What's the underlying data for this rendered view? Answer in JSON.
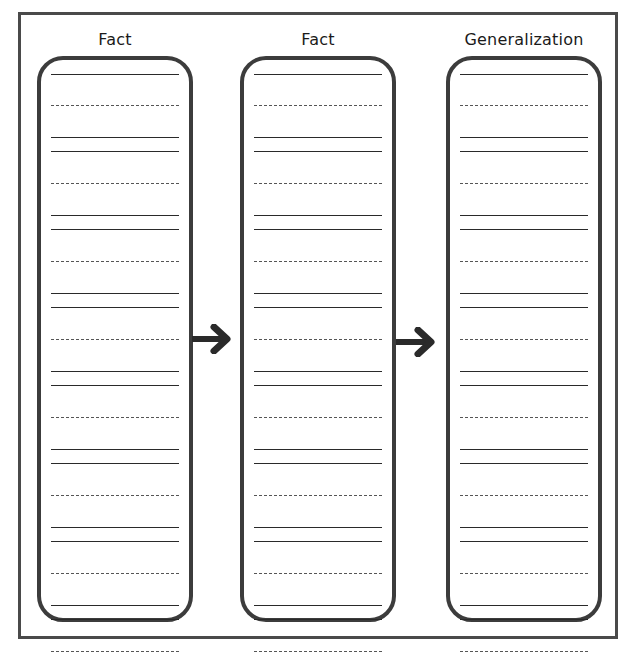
{
  "worksheet": {
    "columns": [
      {
        "title": "Fact"
      },
      {
        "title": "Fact"
      },
      {
        "title": "Generalization"
      }
    ],
    "writing_rows_per_column": 8,
    "arrows": [
      "arrow-right",
      "arrow-right"
    ],
    "colors": {
      "border": "#3c3c3c",
      "lines": "#2a2a2a",
      "background": "#ffffff"
    }
  }
}
